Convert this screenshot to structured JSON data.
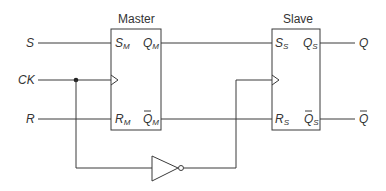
{
  "diagram": {
    "type": "master-slave SR flip-flop",
    "colors": {
      "line": "#3a3a3a",
      "text": "#333333",
      "background": "#ffffff"
    },
    "inputs": {
      "s": "S",
      "ck": "CK",
      "r": "R"
    },
    "outputs": {
      "q": "Q",
      "q_bar": "Q"
    },
    "master": {
      "title": "Master",
      "pins": {
        "s_main": "S",
        "s_sub": "M",
        "q_main": "Q",
        "q_sub": "M",
        "r_main": "R",
        "r_sub": "M",
        "qbar_main": "Q",
        "qbar_sub": "M"
      }
    },
    "slave": {
      "title": "Slave",
      "pins": {
        "s_main": "S",
        "s_sub": "S",
        "q_main": "Q",
        "q_sub": "S",
        "r_main": "R",
        "r_sub": "S",
        "qbar_main": "Q",
        "qbar_sub": "S"
      }
    },
    "components": [
      "master-flipflop",
      "slave-flipflop",
      "inverter",
      "junction-dot"
    ]
  }
}
